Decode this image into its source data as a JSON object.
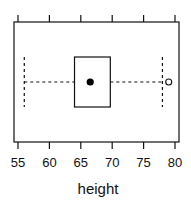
{
  "chart_data": {
    "type": "boxplot",
    "title": "",
    "xlabel": "height",
    "ylabel": "",
    "xlim": [
      54.4,
      80.6
    ],
    "ticks": [
      55,
      60,
      65,
      70,
      75,
      80
    ],
    "tick_labels": [
      "55",
      "60",
      "65",
      "70",
      "75",
      "80"
    ],
    "grid": false,
    "legend": null,
    "orientation": "horizontal",
    "series": [
      {
        "name": "height",
        "whisker_low": 56,
        "q1": 64,
        "median": 66.5,
        "q3": 69.7,
        "whisker_high": 78,
        "outliers": [
          79
        ]
      }
    ]
  },
  "colors": {
    "frame": "#111111",
    "box": "#111111",
    "median_dot": "#000000",
    "outlier": "#111111",
    "background": "#ffffff"
  }
}
